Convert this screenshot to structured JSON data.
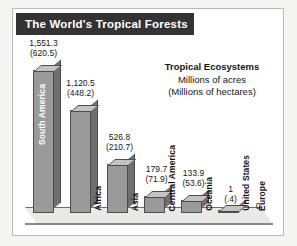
{
  "title": "The World's Tropical Forests",
  "caption": {
    "line1": "Tropical Ecosystems",
    "line2": "Millions of acres",
    "line3": "(Millions of hectares)"
  },
  "chart_data": {
    "type": "bar",
    "title": "The World's Tropical Forests",
    "subtitle": "Tropical Ecosystems",
    "unit_primary": "Millions of acres",
    "unit_secondary": "(Millions of hectares)",
    "xlabel": "",
    "ylabel": "Millions of acres",
    "ylim": [
      0,
      1600
    ],
    "grid": false,
    "legend": "none",
    "categories": [
      "South America",
      "Africa",
      "Asia",
      "Central America",
      "Oceania",
      "United States",
      "Europe"
    ],
    "values": [
      1551.3,
      1120.5,
      526.8,
      179.7,
      133.9,
      1,
      0
    ],
    "values_hectares": [
      620.5,
      448.2,
      210.7,
      71.9,
      53.6,
      0.4,
      0
    ],
    "value_labels": [
      "1,551.3",
      "1,120.5",
      "526.8",
      "179.7",
      "133.9",
      "1",
      "0"
    ],
    "hectare_labels": [
      "(620.5)",
      "(448.2)",
      "(210.7)",
      "(71.9)",
      "(53.6)",
      "(.4)",
      ""
    ],
    "bars": [
      {
        "name": "South America",
        "acres": "1,551.3",
        "hectares": "(620.5)",
        "left": 20,
        "width": 21,
        "height": 143,
        "label_pos": "inside",
        "val_top": -32,
        "val_left": -6
      },
      {
        "name": "Africa",
        "acres": "1,120.5",
        "hectares": "(448.2)",
        "left": 57,
        "width": 21,
        "height": 103,
        "label_pos": "outside",
        "val_top": -32,
        "val_left": -6
      },
      {
        "name": "Asia",
        "acres": "526.8",
        "hectares": "(210.7)",
        "left": 94,
        "width": 21,
        "height": 49,
        "label_pos": "outside",
        "val_top": -32,
        "val_left": -4
      },
      {
        "name": "Central America",
        "acres": "179.7",
        "hectares": "(71.9)",
        "left": 131,
        "width": 21,
        "height": 17,
        "label_pos": "outside",
        "val_top": -32,
        "val_left": -4
      },
      {
        "name": "Oceania",
        "acres": "133.9",
        "hectares": "(53.6)",
        "left": 168,
        "width": 21,
        "height": 13,
        "label_pos": "outside",
        "val_top": -32,
        "val_left": -4
      },
      {
        "name": "United States",
        "acres": "1",
        "hectares": "(.4)",
        "left": 205,
        "width": 21,
        "height": 3,
        "label_pos": "outside",
        "val_top": -26,
        "val_left": -4
      },
      {
        "name": "Europe",
        "acres": "0",
        "hectares": "",
        "left": 242,
        "width": 0,
        "height": 0,
        "label_pos": "outside",
        "val_top": -12,
        "val_left": -4
      }
    ]
  }
}
